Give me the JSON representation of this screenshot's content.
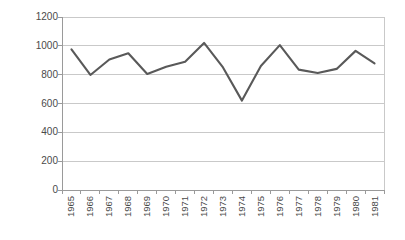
{
  "chart_data": {
    "type": "line",
    "title": "",
    "xlabel": "",
    "ylabel": "다우존스 산업평균지수",
    "categories": [
      "1965",
      "1966",
      "1967",
      "1968",
      "1969",
      "1970",
      "1971",
      "1972",
      "1973",
      "1974",
      "1975",
      "1976",
      "1977",
      "1978",
      "1979",
      "1980",
      "1981"
    ],
    "values": [
      975,
      798,
      905,
      948,
      805,
      855,
      890,
      1020,
      850,
      620,
      860,
      1005,
      835,
      812,
      840,
      965,
      878
    ],
    "series": [
      {
        "name": "다우존스 산업평균지수",
        "values": [
          975,
          798,
          905,
          948,
          805,
          855,
          890,
          1020,
          850,
          620,
          860,
          1005,
          835,
          812,
          840,
          965,
          878
        ]
      }
    ],
    "ylim": [
      0,
      1200
    ],
    "ytick_labels": [
      "0",
      "200",
      "400",
      "600",
      "800",
      "1000",
      "1200"
    ],
    "ytick_values": [
      0,
      200,
      400,
      600,
      800,
      1000,
      1200
    ],
    "grid": true,
    "legend": "none",
    "line_color": "#595959",
    "grid_color": "#c9c9c9",
    "axis_color": "#9a9a9a",
    "background_color": "#ffffff",
    "text_color": "#4a4a4a"
  }
}
